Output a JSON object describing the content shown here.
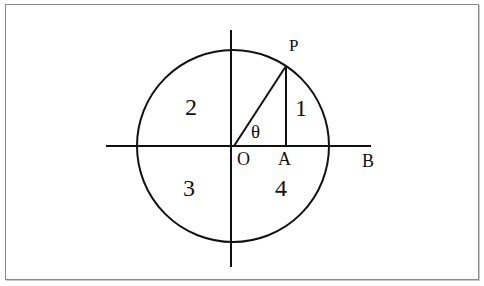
{
  "diagram": {
    "labels": {
      "point_p": "P",
      "origin": "O",
      "foot_a": "A",
      "axis_end_b": "B",
      "angle": "θ"
    },
    "quadrants": [
      {
        "id": 1,
        "label": "1"
      },
      {
        "id": 2,
        "label": "2"
      },
      {
        "id": 3,
        "label": "3"
      },
      {
        "id": 4,
        "label": "4"
      }
    ],
    "colors": {
      "stroke": "#111111",
      "background": "#ffffff",
      "border": "#8a8a8a"
    }
  }
}
